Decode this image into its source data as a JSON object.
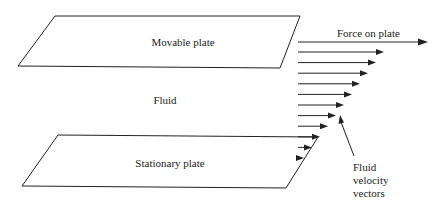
{
  "diagram": {
    "type": "couette-flow",
    "labels": {
      "movable_plate": "Movable plate",
      "stationary_plate": "Stationary plate",
      "fluid": "Fluid",
      "force": "Force on plate",
      "vectors_line1": "Fluid",
      "vectors_line2": "velocity",
      "vectors_line3": "vectors"
    },
    "velocity_profile": {
      "profile_shape": "linear",
      "vector_count": 11,
      "relative_magnitudes": [
        1.0,
        0.9,
        0.8,
        0.7,
        0.6,
        0.5,
        0.4,
        0.3,
        0.2,
        0.1,
        0.0
      ]
    },
    "colors": {
      "stroke": "#222222",
      "background": "#ffffff"
    }
  }
}
